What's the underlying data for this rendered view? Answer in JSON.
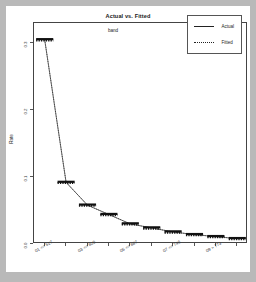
{
  "chart_data": {
    "type": "line",
    "title": "Actual vs. Fitted",
    "xlabel": "band",
    "ylabel": "Rate",
    "grid": false,
    "legend_position": "top-right",
    "categories": [
      "01",
      "02",
      "03",
      "04",
      "05",
      "06",
      "07",
      "08",
      "09",
      "10"
    ],
    "x": [
      1,
      2,
      3,
      4,
      5,
      6,
      7,
      8,
      9,
      10
    ],
    "xlim": [
      0.5,
      10.5
    ],
    "ylim": [
      0.0,
      0.33
    ],
    "yticks": [
      0.0,
      0.1,
      0.2,
      0.3
    ],
    "yticklabels": [
      "0.0",
      "0.1",
      "0.2",
      "0.3"
    ],
    "xticks": [
      1,
      2,
      3,
      4,
      5,
      6,
      7,
      8,
      9,
      10
    ],
    "xticklabels": [
      "01 <= 517",
      "02 <= 570",
      "03 <= 605",
      "04 <= 640",
      "05 <= 667",
      "06 <= 705",
      "07 <= 746",
      "08 <= 773",
      "09 > 773",
      "10 > 773"
    ],
    "xticklabels_shown": [
      {
        "index": 0,
        "text": "01 <= 517"
      },
      {
        "index": 2,
        "text": "03 <= 605"
      },
      {
        "index": 4,
        "text": "05 <= 667"
      },
      {
        "index": 6,
        "text": "07 <= 746"
      },
      {
        "index": 8,
        "text": "09 > 773"
      }
    ],
    "series": [
      {
        "name": "Actual",
        "style": "solid",
        "color": "#111111",
        "values": [
          0.305,
          0.092,
          0.058,
          0.044,
          0.03,
          0.024,
          0.018,
          0.014,
          0.011,
          0.008
        ]
      },
      {
        "name": "Fitted",
        "style": "dotted",
        "color": "#111111",
        "values": [
          0.305,
          0.092,
          0.058,
          0.044,
          0.03,
          0.024,
          0.018,
          0.014,
          0.011,
          0.008
        ]
      }
    ]
  },
  "legend": {
    "entries": [
      {
        "label": "Actual",
        "style": "solid"
      },
      {
        "label": "Fitted",
        "style": "dotted"
      }
    ]
  },
  "colors": {
    "page_background": "#b9b9b9",
    "card_background": "#ffffff",
    "axis": "#444444",
    "ink": "#111111"
  }
}
